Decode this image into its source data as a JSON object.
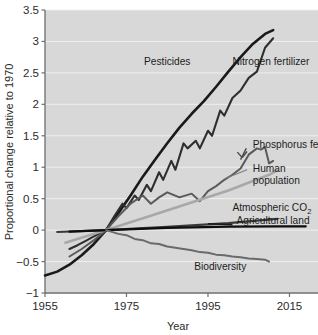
{
  "chart_data": {
    "type": "line",
    "title": "",
    "xlabel": "Year",
    "ylabel": "Proportional change relative to 1970",
    "xlim": [
      1955,
      2022
    ],
    "ylim": [
      -1,
      3.5
    ],
    "grid": true,
    "legend": "inline-labels",
    "background_color": "#d8d8d8",
    "xticks": [
      "1955",
      "1975",
      "1995",
      "2015"
    ],
    "xtick_values": [
      1955,
      1975,
      1995,
      2015
    ],
    "yticks": [
      "3.5",
      "3",
      "2.5",
      "2",
      "1.5",
      "1",
      "0.5",
      "0",
      "-0.5",
      "-1"
    ],
    "ytick_values": [
      3.5,
      3,
      2.5,
      2,
      1.5,
      1,
      0.5,
      0,
      -0.5,
      -1
    ],
    "series": [
      {
        "name": "Nitrogen fertilizer",
        "label": "Nitrogen fertilizer",
        "color": "#1a1a1a",
        "width": 2.6,
        "x": [
          1955,
          1958,
          1961,
          1964,
          1967,
          1970,
          1973,
          1976,
          1979,
          1982,
          1985,
          1988,
          1991,
          1994,
          1997,
          2000,
          2003,
          2006,
          2009,
          2011
        ],
        "values": [
          -0.72,
          -0.66,
          -0.55,
          -0.4,
          -0.22,
          0.0,
          0.27,
          0.55,
          0.85,
          1.12,
          1.38,
          1.63,
          1.85,
          2.05,
          2.28,
          2.52,
          2.75,
          2.96,
          3.12,
          3.18
        ]
      },
      {
        "name": "Pesticides",
        "label": "Pesticides",
        "color": "#2e2e2e",
        "width": 2.1,
        "x": [
          1961,
          1963,
          1965,
          1967,
          1969,
          1970,
          1972,
          1974,
          1975,
          1977,
          1978,
          1980,
          1981,
          1983,
          1984,
          1986,
          1987,
          1989,
          1990,
          1992,
          1993,
          1995,
          1996,
          1998,
          1999,
          2001,
          2003,
          2005,
          2007,
          2009,
          2011
        ],
        "values": [
          -0.3,
          -0.24,
          -0.17,
          -0.1,
          -0.03,
          0.0,
          0.22,
          0.42,
          0.35,
          0.55,
          0.48,
          0.72,
          0.62,
          0.92,
          0.8,
          1.1,
          0.96,
          1.38,
          1.3,
          1.42,
          1.3,
          1.58,
          1.5,
          1.9,
          1.82,
          2.1,
          2.22,
          2.42,
          2.52,
          2.9,
          3.05
        ]
      },
      {
        "name": "Phosphorus fertilizer",
        "label": "Phosphorus fertilizer",
        "color": "#5a5a5a",
        "width": 2.0,
        "x": [
          1961,
          1964,
          1967,
          1970,
          1973,
          1976,
          1979,
          1981,
          1983,
          1985,
          1988,
          1991,
          1993,
          1995,
          1997,
          1999,
          2001,
          2003,
          2005,
          2007,
          2008,
          2009,
          2010,
          2011
        ],
        "values": [
          -0.42,
          -0.3,
          -0.16,
          0.0,
          0.22,
          0.42,
          0.55,
          0.42,
          0.52,
          0.6,
          0.52,
          0.58,
          0.46,
          0.62,
          0.7,
          0.8,
          0.88,
          0.98,
          1.2,
          1.3,
          1.28,
          1.32,
          1.06,
          1.1
        ]
      },
      {
        "name": "Human population",
        "label": "Human population",
        "color": "#a8a8a8",
        "width": 2.6,
        "x": [
          1960,
          1970,
          1980,
          1990,
          2000,
          2010,
          2012
        ],
        "values": [
          -0.2,
          0.0,
          0.21,
          0.42,
          0.63,
          0.88,
          0.95
        ]
      },
      {
        "name": "Atmospheric CO2",
        "label": "Atmospheric CO₂",
        "color": "#3a3a3a",
        "width": 2.2,
        "x": [
          1958,
          1970,
          1985,
          2000,
          2012
        ],
        "values": [
          -0.03,
          0.0,
          0.05,
          0.11,
          0.18
        ]
      },
      {
        "name": "Agricultural land",
        "label": "Agricultural land",
        "color": "#0d0d0d",
        "width": 2.2,
        "x": [
          1961,
          1970,
          1985,
          2000,
          2012,
          2019
        ],
        "values": [
          -0.025,
          0.0,
          0.035,
          0.055,
          0.06,
          0.06
        ]
      },
      {
        "name": "Biodiversity",
        "label": "Biodiversity",
        "color": "#6a6a6a",
        "width": 2.0,
        "x": [
          1970,
          1973,
          1975,
          1977,
          1979,
          1981,
          1983,
          1985,
          1987,
          1989,
          1991,
          1993,
          1995,
          1997,
          1999,
          2001,
          2003,
          2005,
          2007,
          2009,
          2010
        ],
        "values": [
          0.0,
          -0.06,
          -0.08,
          -0.14,
          -0.16,
          -0.21,
          -0.22,
          -0.26,
          -0.28,
          -0.3,
          -0.32,
          -0.35,
          -0.36,
          -0.39,
          -0.4,
          -0.42,
          -0.43,
          -0.45,
          -0.46,
          -0.47,
          -0.5
        ]
      }
    ],
    "annotations": [
      {
        "text": "Pesticides",
        "x": 1985,
        "y": 2.62
      },
      {
        "text": "Nitrogen fertilizer",
        "x": 2001,
        "y": 2.62
      },
      {
        "text": "Phosphorus fertilizer",
        "x": 2006,
        "y": 1.3
      },
      {
        "text": "Human population",
        "x": 2006,
        "y": 0.92
      },
      {
        "text": "Atmospheric CO₂",
        "x": 2001,
        "y": 0.3
      },
      {
        "text": "Agricultural land",
        "x": 2002,
        "y": 0.09
      },
      {
        "text": "Biodiversity",
        "x": 1998,
        "y": -0.63
      }
    ]
  }
}
